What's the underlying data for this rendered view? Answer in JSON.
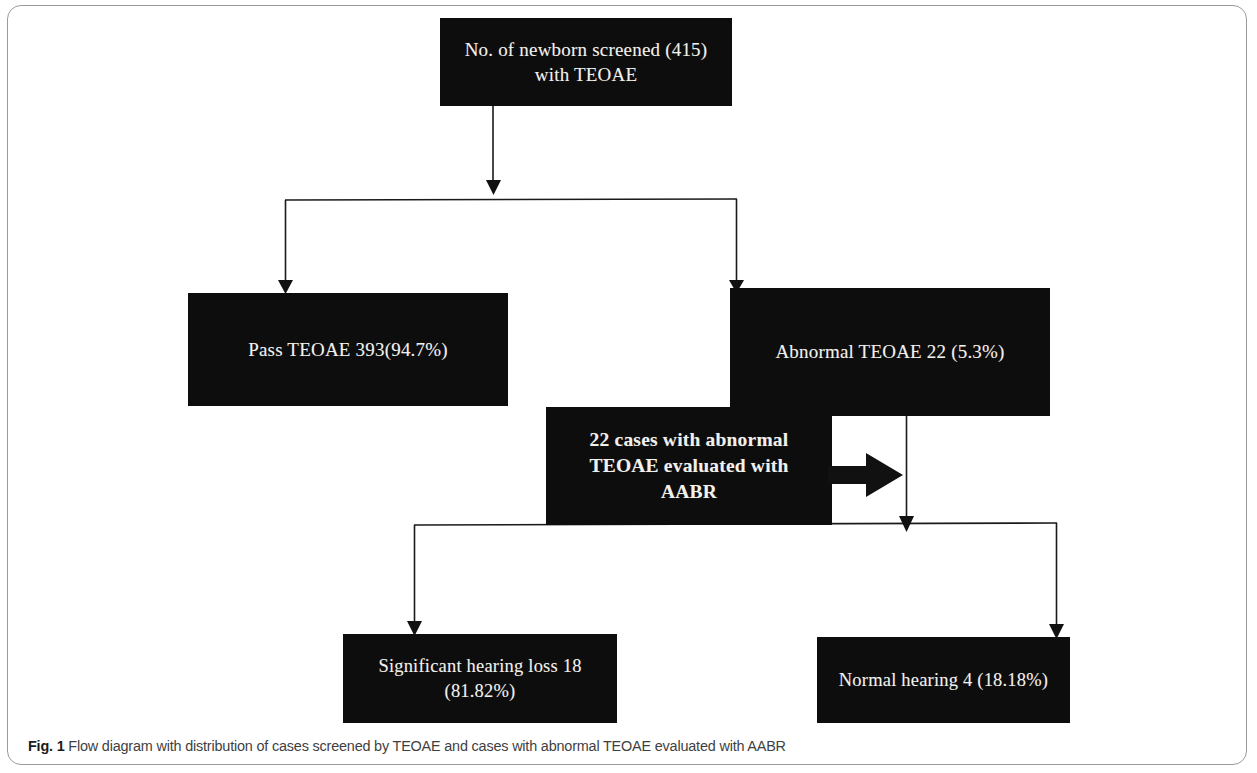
{
  "figure": {
    "caption_label": "Fig. 1",
    "caption_text": "Flow diagram with distribution of cases screened by TEOAE and cases with abnormal TEOAE evaluated with AABR",
    "node_fill": "#0d0d0d",
    "node_text_color": "#f2f0ec",
    "frame_color": "#9b9b9b"
  },
  "nodes": {
    "screened": {
      "label": "No. of newborn screened (415)\nwith TEOAE",
      "total": 415
    },
    "pass": {
      "label": "Pass TEOAE 393(94.7%)",
      "count": 393,
      "percent": "94.7%"
    },
    "abnormal": {
      "label": "Abnormal TEOAE 22 (5.3%)",
      "count": 22,
      "percent": "5.3%"
    },
    "aabr": {
      "label": "22 cases with abnormal\nTEOAE evaluated with\nAABR",
      "count": 22
    },
    "hearing_loss": {
      "label": "Significant hearing loss 18\n(81.82%)",
      "count": 18,
      "percent": "81.82%"
    },
    "normal_hearing": {
      "label": "Normal hearing 4 (18.18%)",
      "count": 4,
      "percent": "18.18%"
    }
  },
  "edges": [
    {
      "name": "screened-to-split",
      "from": "screened",
      "to": "split-1"
    },
    {
      "name": "split-to-pass",
      "from": "split-1",
      "to": "pass"
    },
    {
      "name": "split-to-abnormal",
      "from": "split-1",
      "to": "abnormal"
    },
    {
      "name": "aabr-to-abnormal-column",
      "from": "aabr",
      "to": "split-2",
      "style": "block-arrow"
    },
    {
      "name": "split-to-hearing-loss",
      "from": "split-2",
      "to": "hearing_loss"
    },
    {
      "name": "split-to-normal-hearing",
      "from": "split-2",
      "to": "normal_hearing"
    }
  ]
}
